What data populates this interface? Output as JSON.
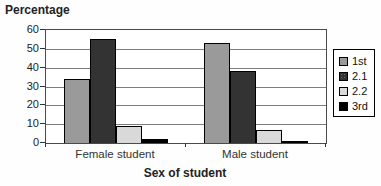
{
  "chart_data": {
    "type": "bar",
    "title": "Percentage",
    "xlabel": "Sex of student",
    "ylabel": "Percentage",
    "categories": [
      "Female student",
      "Male student"
    ],
    "series": [
      {
        "name": "1st",
        "color": "#9a9a9a",
        "texture": "solid",
        "values": [
          34,
          53
        ]
      },
      {
        "name": "2.1",
        "color": "#333333",
        "texture": "dots",
        "values": [
          55,
          38
        ]
      },
      {
        "name": "2.2",
        "color": "#d9d9d9",
        "texture": "solid",
        "values": [
          9,
          7
        ]
      },
      {
        "name": "3rd",
        "color": "#000000",
        "texture": "solid",
        "values": [
          2,
          1
        ]
      }
    ],
    "ylim": [
      0,
      60
    ],
    "yticks": [
      0,
      10,
      20,
      30,
      40,
      50,
      60
    ],
    "grid": true,
    "legend_position": "right",
    "legend_labels": [
      "1st",
      "2.1",
      "2.2",
      "3rd"
    ]
  }
}
